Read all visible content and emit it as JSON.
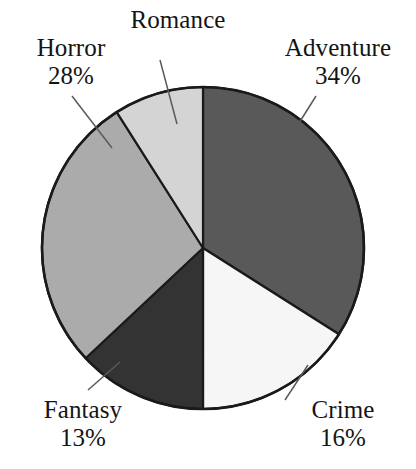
{
  "chart_data": {
    "type": "pie",
    "title": "",
    "subtitle": "",
    "xlabel": "",
    "ylabel": "",
    "legend_position": "none",
    "grid": false,
    "units": "percent",
    "total": 100,
    "start_angle_deg": 0,
    "direction": "clockwise",
    "categories": [
      "Adventure",
      "Crime",
      "Fantasy",
      "Horror",
      "Romance"
    ],
    "values": [
      34,
      16,
      13,
      28,
      9
    ],
    "slices": [
      {
        "label": "Adventure",
        "value": 34,
        "value_label": "34%",
        "color": "#595959",
        "stroke": "#1a1a1a",
        "start_deg": 0,
        "end_deg": 122.4,
        "label_shown": true
      },
      {
        "label": "Crime",
        "value": 16,
        "value_label": "16%",
        "color": "#f6f6f6",
        "stroke": "#1a1a1a",
        "start_deg": 122.4,
        "end_deg": 180.0,
        "label_shown": true
      },
      {
        "label": "Fantasy",
        "value": 13,
        "value_label": "13%",
        "color": "#333333",
        "stroke": "#1a1a1a",
        "start_deg": 180.0,
        "end_deg": 226.8,
        "label_shown": true
      },
      {
        "label": "Horror",
        "value": 28,
        "value_label": "28%",
        "color": "#ababab",
        "stroke": "#1a1a1a",
        "start_deg": 226.8,
        "end_deg": 327.6,
        "label_shown": true
      },
      {
        "label": "Romance",
        "value": 9,
        "value_label": "",
        "color": "#d4d4d4",
        "stroke": "#1a1a1a",
        "start_deg": 327.6,
        "end_deg": 360.0,
        "label_shown": true
      }
    ]
  },
  "labels": {
    "horror": {
      "name": "Horror",
      "pct": "28%"
    },
    "romance": {
      "name": "Romance",
      "pct": ""
    },
    "adventure": {
      "name": "Adventure",
      "pct": "34%"
    },
    "fantasy": {
      "name": "Fantasy",
      "pct": "13%"
    },
    "crime": {
      "name": "Crime",
      "pct": "16%"
    }
  },
  "colors": {
    "background": "#ffffff",
    "outline": "#1a1a1a",
    "leader_line": "#4a4a4a",
    "text": "#141414",
    "adventure": "#595959",
    "crime": "#f6f6f6",
    "fantasy": "#333333",
    "horror": "#ababab",
    "romance": "#d4d4d4"
  }
}
